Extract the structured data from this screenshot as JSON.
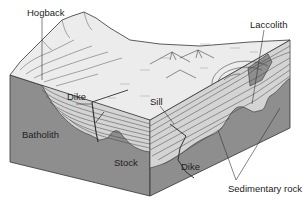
{
  "figure": {
    "type": "block-diagram",
    "colors": {
      "background": "#ffffff",
      "surface": "#ececec",
      "igneous": "#8e8e8e",
      "sedimentary": "#d4d4d4",
      "lines": "#333333"
    },
    "labels": {
      "hogback": "Hogback",
      "laccolith": "Laccolith",
      "dike_upper": "Dike",
      "sill": "Sill",
      "batholith": "Batholith",
      "stock": "Stock",
      "dike_lower": "Dike",
      "sedimentary_rock": "Sedimentary rock"
    }
  }
}
